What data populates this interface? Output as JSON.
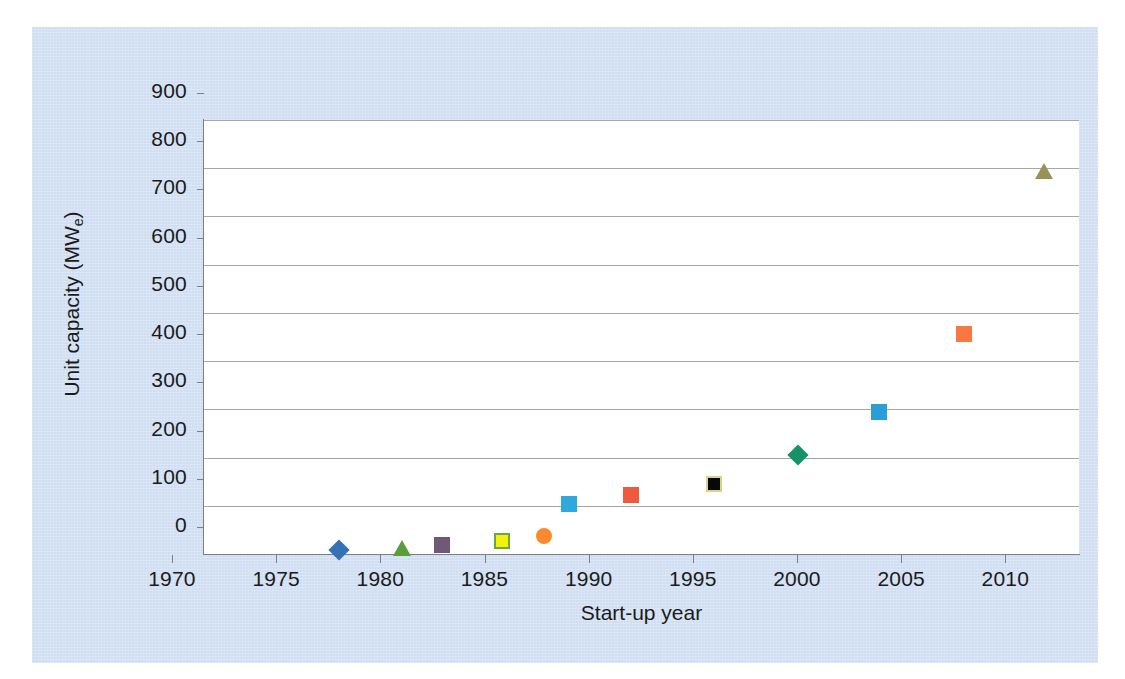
{
  "chart_data": {
    "type": "scatter",
    "title": "",
    "xlabel": "Start-up year",
    "ylabel": "Unit capacity (MWe)",
    "ylabel_base": "Unit capacity (MW",
    "ylabel_sub": "e",
    "ylabel_tail": ")",
    "xlim": [
      1970,
      2012
    ],
    "ylim": [
      0,
      900
    ],
    "grid": "horizontal",
    "legend": "none",
    "xticks": [
      1970,
      1975,
      1980,
      1985,
      1990,
      1995,
      2000,
      2005,
      2010
    ],
    "xtick_labels": [
      "1970",
      "1975",
      "1980",
      "1985",
      "1990",
      "1995",
      "2000",
      "2005",
      "2010"
    ],
    "yticks": [
      0,
      100,
      200,
      300,
      400,
      500,
      600,
      700,
      800,
      900
    ],
    "ytick_labels": [
      "0",
      "100",
      "200",
      "300",
      "400",
      "500",
      "600",
      "700",
      "800",
      "900"
    ],
    "points": [
      {
        "name": "point-1976-blue-diamond",
        "x": 1976.5,
        "y": 8,
        "shape": "diamond",
        "fill": "#3372b5",
        "stroke": "#3372b5"
      },
      {
        "name": "point-1979-green-triangle",
        "x": 1979.5,
        "y": 12,
        "shape": "triangle",
        "fill": "#5b9c3c",
        "stroke": "#5b9c3c"
      },
      {
        "name": "point-1981-purple-square",
        "x": 1981.4,
        "y": 18,
        "shape": "square",
        "fill": "#6e5a77",
        "stroke": "#6e5a77"
      },
      {
        "name": "point-1984-yellow-square",
        "x": 1984.3,
        "y": 27,
        "shape": "square",
        "fill": "#f2f20a",
        "stroke": "#6aa844"
      },
      {
        "name": "point-1986-orange-circle",
        "x": 1986.3,
        "y": 38,
        "shape": "circle",
        "fill": "#f78b2d",
        "stroke": "#f78b2d"
      },
      {
        "name": "point-1987-blue-square",
        "x": 1987.5,
        "y": 103,
        "shape": "square",
        "fill": "#31a8dd",
        "stroke": "#31a8dd"
      },
      {
        "name": "point-1990-red-square",
        "x": 1990.5,
        "y": 123,
        "shape": "square",
        "fill": "#f05a3c",
        "stroke": "#f05a3c"
      },
      {
        "name": "point-1994-black-square",
        "x": 1994.5,
        "y": 146,
        "shape": "square",
        "fill": "#080808",
        "stroke": "#d9d488"
      },
      {
        "name": "point-1998-teal-diamond",
        "x": 1998.5,
        "y": 205,
        "shape": "diamond",
        "fill": "#159367",
        "stroke": "#159367"
      },
      {
        "name": "point-2002-blue-square",
        "x": 2002.4,
        "y": 295,
        "shape": "square",
        "fill": "#2b9ed8",
        "stroke": "#2b9ed8"
      },
      {
        "name": "point-2006-orange-square",
        "x": 2006.5,
        "y": 456,
        "shape": "square",
        "fill": "#f97741",
        "stroke": "#f97741"
      },
      {
        "name": "point-2010-olive-triangle",
        "x": 2010.3,
        "y": 795,
        "shape": "triangle",
        "fill": "#9a9255",
        "stroke": "#9a9255"
      }
    ]
  },
  "colors": {
    "panel_background": "#cfdef2",
    "plot_background": "#ffffff",
    "gridline": "#a6a6a6",
    "axis": "#808080",
    "text": "#1b1b1b"
  }
}
